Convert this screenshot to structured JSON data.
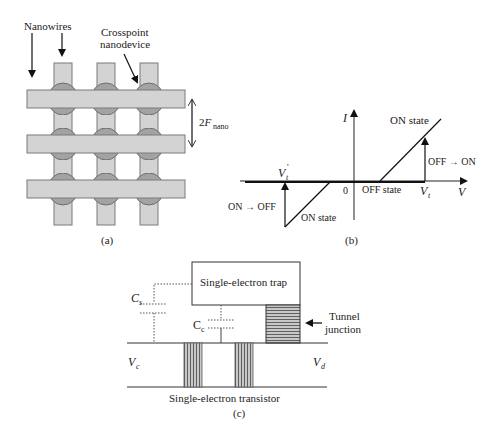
{
  "colors": {
    "wire_fill": "#d3d3d3",
    "wire_stroke": "#7a7a7a",
    "device_fill": "#9e9e9e",
    "device_stroke": "#6e6e6e",
    "line": "#222222",
    "hatch": "#555555",
    "hatch_bg": "#bdbdbd"
  },
  "panel_a": {
    "caption": "(a)",
    "labels": {
      "nanowires": "Nanowires",
      "crosspoint_line1": "Crosspoint",
      "crosspoint_line2": "nanodevice",
      "pitch_main": "2F",
      "pitch_sub": "nano"
    },
    "grid": {
      "rows": 3,
      "cols": 3
    }
  },
  "panel_b": {
    "caption": "(b)",
    "axis_labels": {
      "y": "I",
      "x": "V",
      "origin": "0"
    },
    "labels": {
      "on_state_upper": "ON state",
      "off_to_on": "OFF → ON",
      "off_state": "OFF state",
      "vt_main": "V",
      "vt_sub": "t",
      "vt_prime_main": "V",
      "vt_prime_sub": "t",
      "vt_prime_mark": "'",
      "on_to_off": "ON → OFF",
      "on_state_lower": "ON state"
    }
  },
  "panel_c": {
    "caption": "(c)",
    "labels": {
      "trap": "Single-electron trap",
      "cs_main": "C",
      "cs_sub": "s",
      "cc_main": "C",
      "cc_sub": "c",
      "tunnel_line1": "Tunnel",
      "tunnel_line2": "junction",
      "vc_main": "V",
      "vc_sub": "c",
      "vd_main": "V",
      "vd_sub": "d",
      "transistor": "Single-electron transistor"
    }
  }
}
